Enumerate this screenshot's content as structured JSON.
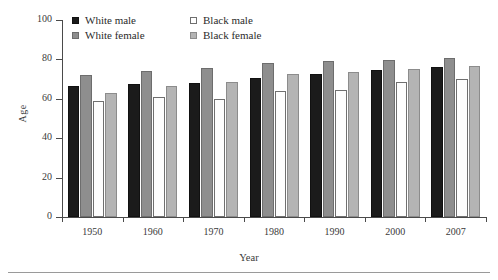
{
  "chart_data": {
    "type": "bar",
    "title": "",
    "xlabel": "Year",
    "ylabel": "Age",
    "categories": [
      "1950",
      "1960",
      "1970",
      "1980",
      "1990",
      "2000",
      "2007"
    ],
    "ylim": [
      0,
      100
    ],
    "yticks": [
      "0",
      "20",
      "40",
      "60",
      "80",
      "100"
    ],
    "grid": false,
    "legend_position": "top-left",
    "series": [
      {
        "name": "White male",
        "color": "#1b1b1b",
        "values": [
          66.5,
          67.4,
          68.0,
          70.7,
          72.7,
          74.7,
          75.9
        ]
      },
      {
        "name": "White female",
        "color": "#8e8e8e",
        "values": [
          72.2,
          74.1,
          75.6,
          78.1,
          79.4,
          79.9,
          80.6
        ]
      },
      {
        "name": "Black male",
        "color": "#ffffff",
        "values": [
          59.1,
          61.1,
          60.0,
          63.8,
          64.5,
          68.3,
          70.0
        ]
      },
      {
        "name": "Black female",
        "color": "#b4b4b4",
        "values": [
          62.9,
          66.3,
          68.3,
          72.5,
          73.6,
          75.2,
          76.8
        ]
      }
    ]
  }
}
